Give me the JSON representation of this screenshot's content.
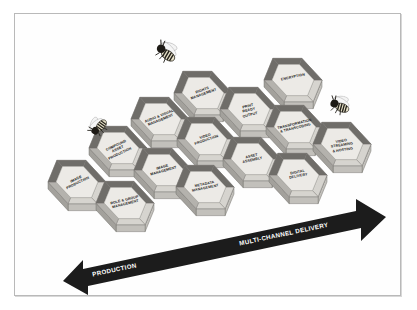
{
  "diagram": {
    "background_color": "#ffffff",
    "frame_color": "#b9b9b9",
    "hex_face_color": "#eceae6",
    "hex_wall_color": "#8f8d88",
    "hex_outline_color": "#6e6c68",
    "arrow_color": "#1c1c1c",
    "label_color": "#1b1b1b",
    "arrow_label_color": "#ffffff"
  },
  "cells": [
    {
      "id": "image-production",
      "label": "IMAGE\nPRODUCTION",
      "cx": 62,
      "cy": 175,
      "rot": -26
    },
    {
      "id": "role-group-management",
      "label": "ROLE & GROUP\nMANAGEMENT",
      "cx": 110,
      "cy": 196,
      "rot": -14
    },
    {
      "id": "compound-asset-production",
      "label": "COMPOUND\nASSET\nPRODUCTION",
      "cx": 103,
      "cy": 141,
      "rot": -25
    },
    {
      "id": "image-management",
      "label": "IMAGE\nMANAGEMENT",
      "cx": 148,
      "cy": 163,
      "rot": -16
    },
    {
      "id": "audio-visual-management",
      "label": "AUDIO & VISUAL\nMANAGEMENT",
      "cx": 145,
      "cy": 112,
      "rot": -22
    },
    {
      "id": "metadata-management",
      "label": "METADATA\nMANAGEMENT",
      "cx": 190,
      "cy": 180,
      "rot": -12
    },
    {
      "id": "video-production",
      "label": "VIDEO\nPRODUCTION",
      "cx": 191,
      "cy": 132,
      "rot": -19
    },
    {
      "id": "rights-management",
      "label": "RIGHTS\nMANAGEMENT",
      "cx": 188,
      "cy": 86,
      "rot": -20
    },
    {
      "id": "asset-assembly",
      "label": "ASSET\nASSEMBLY",
      "cx": 237,
      "cy": 152,
      "rot": -13
    },
    {
      "id": "print-ready-output",
      "label": "PRINT\nREADY\nOUTPUT",
      "cx": 234,
      "cy": 102,
      "rot": -14
    },
    {
      "id": "digital-delivery",
      "label": "DIGITAL\nDELIVERY",
      "cx": 283,
      "cy": 168,
      "rot": -11
    },
    {
      "id": "transformation-transcoding",
      "label": "TRANSFORMATION\n& TRANSCODING",
      "cx": 280,
      "cy": 120,
      "rot": -14
    },
    {
      "id": "encryption",
      "label": "ENCRYPTION",
      "cx": 278,
      "cy": 73,
      "rot": -12
    },
    {
      "id": "video-streaming-hosting",
      "label": "VIDEO\nSTREAMING\n& HOSTING",
      "cx": 327,
      "cy": 137,
      "rot": -9
    }
  ],
  "arrow": {
    "left_label": "PRODUCTION",
    "right_label": "MULTI-CHANNEL DELIVERY",
    "double_headed": true
  },
  "bees": [
    {
      "id": "bee-flying-top",
      "x": 136,
      "y": 27,
      "rot": 35,
      "scale": 1.0,
      "state": "flying"
    },
    {
      "id": "bee-perched-left",
      "x": 70,
      "y": 100,
      "rot": -50,
      "scale": 0.86,
      "state": "perched"
    },
    {
      "id": "bee-perched-right",
      "x": 310,
      "y": 80,
      "rot": 20,
      "scale": 0.92,
      "state": "perched"
    }
  ]
}
